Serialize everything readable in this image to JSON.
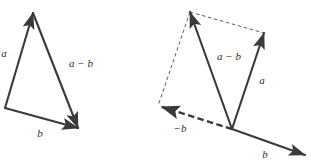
{
  "figure": {
    "background_color": "#ffffff",
    "stroke_color": "#3a3a3a",
    "dashed_thin_color": "#4a4a4a",
    "label_color": "#2e2e2e",
    "panels": [
      {
        "id": "triangle-rule",
        "name": "left-diagram",
        "caption": "",
        "vertices": {
          "origin": [
            5,
            108
          ],
          "a_tip": [
            33,
            13
          ],
          "b_tip": [
            78,
            128
          ]
        },
        "vectors": [
          {
            "name": "vector-a",
            "label": "a",
            "label_pos": [
              5,
              57
            ],
            "from": [
              5,
              108
            ],
            "to": [
              33,
              13
            ],
            "style": "solid",
            "arrow": "end"
          },
          {
            "name": "vector-b",
            "label": "b",
            "label_pos": [
              39,
              136
            ],
            "from": [
              5,
              108
            ],
            "to": [
              78,
              128
            ],
            "style": "solid",
            "arrow": "end"
          },
          {
            "name": "vector-a-minus-b",
            "label": "a − b",
            "label_pos": [
              68,
              67
            ],
            "from": [
              33,
              13
            ],
            "to": [
              78,
              128
            ],
            "style": "solid",
            "arrow": "end"
          }
        ]
      },
      {
        "id": "parallelogram-rule",
        "name": "right-diagram",
        "caption": "",
        "vertices": {
          "origin": [
            232,
            129
          ],
          "a_tip": [
            264,
            33
          ],
          "minus_b_tip": [
            158,
            106
          ],
          "a_minus_b_tip": [
            190,
            12
          ]
        },
        "vectors": [
          {
            "name": "vector-a",
            "label": "a",
            "label_pos": [
              258,
              84
            ],
            "from": [
              232,
              129
            ],
            "to": [
              264,
              33
            ],
            "style": "solid",
            "arrow": "end"
          },
          {
            "name": "vector-b",
            "label": "b",
            "label_pos": [
              262,
              158
            ],
            "from": [
              232,
              129
            ],
            "to": [
              305,
              155
            ],
            "style": "solid",
            "arrow": "end"
          },
          {
            "name": "vector-minus-b",
            "label": "−b",
            "label_pos": [
              172,
              132
            ],
            "from": [
              232,
              129
            ],
            "to": [
              158,
              106
            ],
            "style": "dashed-thick",
            "arrow": "end"
          },
          {
            "name": "vector-a-minus-b",
            "label": "a − b",
            "label_pos": [
              215,
              60
            ],
            "from": [
              232,
              129
            ],
            "to": [
              190,
              12
            ],
            "style": "solid",
            "arrow": "end"
          }
        ],
        "construction_lines": [
          {
            "name": "parallel-edge-top",
            "from": [
              190,
              12
            ],
            "to": [
              264,
              33
            ],
            "style": "dashed-thin"
          },
          {
            "name": "parallel-edge-left",
            "from": [
              190,
              12
            ],
            "to": [
              158,
              106
            ],
            "style": "dashed-thin"
          }
        ]
      }
    ]
  }
}
